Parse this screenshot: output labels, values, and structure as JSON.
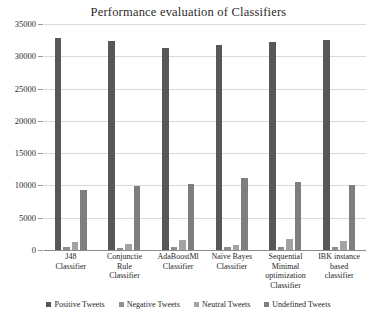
{
  "chart_data": {
    "type": "bar",
    "title": "Performance evaluation  of Classifiers",
    "xlabel": "",
    "ylabel": "",
    "ylim": [
      0,
      35000
    ],
    "ytick_step": 5000,
    "yticks": [
      "0",
      "5000",
      "10000",
      "15000",
      "20000",
      "25000",
      "30000",
      "35000"
    ],
    "grid": true,
    "legend_position": "bottom",
    "categories": [
      "J48 Classifier",
      "Conjunctie Rule Classifier",
      "AdaBoostMl Classifier",
      "Naïve Bayes Classifier",
      "Sequential Minimal optimization Classifier",
      "IBK instance based classifier"
    ],
    "category_lines": [
      [
        "J48",
        "Classifier"
      ],
      [
        "Conjunctie",
        "Rule",
        "Classifier"
      ],
      [
        "AdaBoostMl",
        "Classifier"
      ],
      [
        "Naïve Bayes",
        "Classifier"
      ],
      [
        "Sequential",
        "Minimal",
        "optimization",
        "Classifier"
      ],
      [
        "IBK instance",
        "based",
        "classifier"
      ]
    ],
    "series": [
      {
        "name": "Positive Tweets",
        "color": "#575757",
        "values": [
          32900,
          32300,
          31300,
          31700,
          32200,
          32500
        ]
      },
      {
        "name": "Negative Tweets",
        "color": "#8e8e8e",
        "values": [
          400,
          300,
          500,
          400,
          400,
          400
        ]
      },
      {
        "name": "Neutral Tweets",
        "color": "#a3a3a3",
        "values": [
          1200,
          1000,
          1500,
          800,
          1700,
          1400
        ]
      },
      {
        "name": "Undefined Tweets",
        "color": "#7e7e7e",
        "values": [
          9300,
          9900,
          10300,
          11200,
          10500,
          10000
        ]
      }
    ]
  }
}
